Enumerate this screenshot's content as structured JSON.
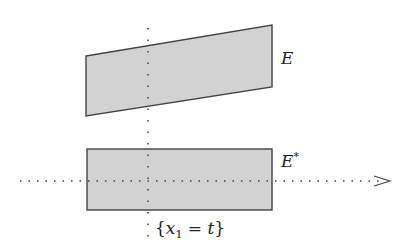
{
  "diagram": {
    "top_shape": {
      "label": "E",
      "points": [
        [
          86,
          56
        ],
        [
          272,
          25
        ],
        [
          272,
          87
        ],
        [
          86,
          116
        ]
      ],
      "fill": "#d2d2d2",
      "stroke": "#444444"
    },
    "bottom_shape": {
      "label": "E",
      "label_sup": "*",
      "rect": {
        "x": 87,
        "y": 149,
        "w": 185,
        "h": 61
      },
      "fill": "#d2d2d2",
      "stroke": "#444444"
    },
    "vertical_line": {
      "x": 148,
      "y1": 28,
      "y2": 240
    },
    "horizontal_axis": {
      "y": 181,
      "x1": 20,
      "x2": 390
    },
    "slice_label": {
      "open": "{",
      "var": "x",
      "sub": "1",
      "eq": " = ",
      "t": "t",
      "close": "}"
    }
  }
}
